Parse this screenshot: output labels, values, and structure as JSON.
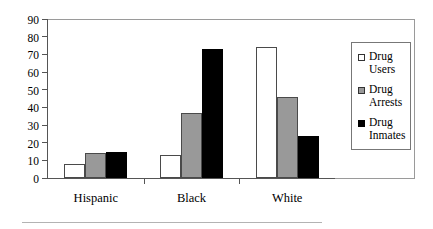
{
  "chart_data": {
    "type": "bar",
    "title": "",
    "subtitle": "",
    "xlabel": "",
    "ylabel": "",
    "ylim": [
      0,
      90
    ],
    "yticks": [
      0,
      10,
      20,
      30,
      40,
      50,
      60,
      70,
      80,
      90
    ],
    "grid": false,
    "legend_position": "right",
    "categories": [
      "Hispanic",
      "Black",
      "White"
    ],
    "series": [
      {
        "name": "Drug Users",
        "legend_line1": "Drug",
        "legend_line2": "Users",
        "color": "#ffffff",
        "swatch": "white-square",
        "values": [
          8,
          13,
          74
        ]
      },
      {
        "name": "Drug Arrests",
        "legend_line1": "Drug",
        "legend_line2": "Arrests",
        "color": "#999999",
        "swatch": "gray-square",
        "values": [
          14,
          37,
          46
        ]
      },
      {
        "name": "Drug Inmates",
        "legend_line1": "Drug",
        "legend_line2": "Inmates",
        "color": "#000000",
        "swatch": "black-square",
        "values": [
          15,
          73,
          24
        ]
      }
    ]
  },
  "axis": {
    "y_tick_labels": [
      "90",
      "80",
      "70",
      "60",
      "50",
      "40",
      "30",
      "20",
      "10",
      "0"
    ],
    "x_tick_labels": [
      "Hispanic",
      "Black",
      "White"
    ]
  }
}
